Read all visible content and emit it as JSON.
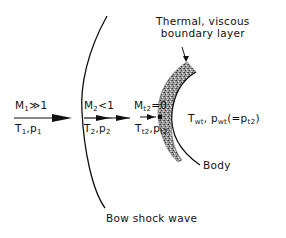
{
  "labels": {
    "boundary_layer": [
      "Thermal, viscous",
      "boundary layer"
    ],
    "region1_top": {
      "main": "M",
      "sub": "1",
      "rest": "≫1"
    },
    "region1_bottom": {
      "a": "T",
      "a_sub": "1",
      "b": ",p",
      "b_sub": "1"
    },
    "region2_top": {
      "main": "M",
      "sub": "2",
      "rest": "<1"
    },
    "region2_bottom": {
      "a": "T",
      "a_sub": "2",
      "b": ",p",
      "b_sub": "2"
    },
    "stag_top": {
      "main": "M",
      "sub": "t2",
      "rest": "=0"
    },
    "stag_bottom": {
      "a": "T",
      "a_sub": "t2",
      "b": ",p",
      "b_sub": "t2"
    },
    "wall": {
      "a": "T",
      "a_sub": "wt",
      "b": ",  p",
      "b_sub": "wt",
      "c": "(=p",
      "c_sub": "t2",
      "d": ")"
    },
    "body": "Body",
    "shock": "Bow shock wave"
  },
  "colors": {
    "line": "#111111",
    "boundary_fill": "#8a8a8a"
  }
}
